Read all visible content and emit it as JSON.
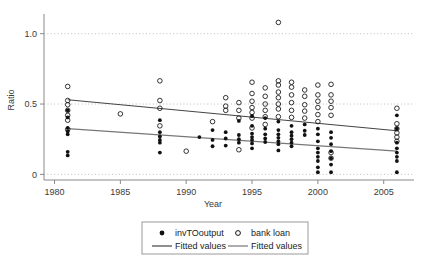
{
  "chart_data": {
    "type": "scatter",
    "title": "",
    "xlabel": "Year",
    "ylabel": "Ratio",
    "xlim": [
      1979.2,
      2007.3
    ],
    "ylim": [
      -0.04,
      1.14
    ],
    "xticks": [
      1980,
      1985,
      1990,
      1995,
      2000,
      2005
    ],
    "xtick_labels": [
      "1980",
      "1985",
      "1990",
      "1995",
      "2000",
      "2005"
    ],
    "yticks": [
      0,
      0.5,
      1.0
    ],
    "ytick_labels": [
      "0",
      "0.5",
      "1.0"
    ],
    "grid": "horizontal-dotted",
    "legend_position": "below-axes",
    "series": [
      {
        "name": "invTOoutput",
        "marker": "filled-circle",
        "color": "#111111",
        "points": [
          [
            1981,
            0.455
          ],
          [
            1981,
            0.405
          ],
          [
            1981,
            0.33
          ],
          [
            1981,
            0.305
          ],
          [
            1981,
            0.285
          ],
          [
            1981,
            0.16
          ],
          [
            1981,
            0.135
          ],
          [
            1988,
            0.385
          ],
          [
            1988,
            0.3
          ],
          [
            1988,
            0.27
          ],
          [
            1988,
            0.245
          ],
          [
            1988,
            0.225
          ],
          [
            1988,
            0.155
          ],
          [
            1991,
            0.265
          ],
          [
            1992,
            0.315
          ],
          [
            1992,
            0.245
          ],
          [
            1992,
            0.2
          ],
          [
            1993,
            0.3
          ],
          [
            1993,
            0.255
          ],
          [
            1993,
            0.205
          ],
          [
            1994,
            0.38
          ],
          [
            1994,
            0.28
          ],
          [
            1994,
            0.25
          ],
          [
            1994,
            0.225
          ],
          [
            1995,
            0.415
          ],
          [
            1995,
            0.345
          ],
          [
            1995,
            0.29
          ],
          [
            1995,
            0.265
          ],
          [
            1995,
            0.245
          ],
          [
            1995,
            0.22
          ],
          [
            1995,
            0.185
          ],
          [
            1996,
            0.4
          ],
          [
            1996,
            0.325
          ],
          [
            1996,
            0.285
          ],
          [
            1996,
            0.255
          ],
          [
            1996,
            0.23
          ],
          [
            1997,
            0.375
          ],
          [
            1997,
            0.315
          ],
          [
            1997,
            0.285
          ],
          [
            1997,
            0.26
          ],
          [
            1997,
            0.235
          ],
          [
            1997,
            0.215
          ],
          [
            1997,
            0.17
          ],
          [
            1998,
            0.345
          ],
          [
            1998,
            0.3
          ],
          [
            1998,
            0.275
          ],
          [
            1998,
            0.25
          ],
          [
            1998,
            0.225
          ],
          [
            1998,
            0.2
          ],
          [
            1999,
            0.355
          ],
          [
            1999,
            0.31
          ],
          [
            1999,
            0.28
          ],
          [
            2000,
            0.325
          ],
          [
            2000,
            0.285
          ],
          [
            2000,
            0.235
          ],
          [
            2000,
            0.185
          ],
          [
            2000,
            0.155
          ],
          [
            2000,
            0.125
          ],
          [
            2000,
            0.095
          ],
          [
            2000,
            0.05
          ],
          [
            2000,
            0.015
          ],
          [
            2001,
            0.3
          ],
          [
            2001,
            0.26
          ],
          [
            2001,
            0.215
          ],
          [
            2001,
            0.165
          ],
          [
            2001,
            0.115
          ],
          [
            2001,
            0.07
          ],
          [
            2001,
            0.015
          ],
          [
            2006,
            0.42
          ],
          [
            2006,
            0.325
          ],
          [
            2006,
            0.225
          ],
          [
            2006,
            0.185
          ],
          [
            2006,
            0.155
          ],
          [
            2006,
            0.125
          ],
          [
            2006,
            0.095
          ],
          [
            2006,
            0.015
          ]
        ]
      },
      {
        "name": "bank loan",
        "marker": "open-circle",
        "color": "#111111",
        "points": [
          [
            1981,
            0.625
          ],
          [
            1981,
            0.525
          ],
          [
            1981,
            0.495
          ],
          [
            1981,
            0.455
          ],
          [
            1981,
            0.42
          ],
          [
            1981,
            0.385
          ],
          [
            1981,
            0.32
          ],
          [
            1985,
            0.43
          ],
          [
            1988,
            0.665
          ],
          [
            1988,
            0.525
          ],
          [
            1988,
            0.47
          ],
          [
            1988,
            0.345
          ],
          [
            1990,
            0.165
          ],
          [
            1992,
            0.375
          ],
          [
            1993,
            0.545
          ],
          [
            1993,
            0.485
          ],
          [
            1993,
            0.455
          ],
          [
            1994,
            0.51
          ],
          [
            1994,
            0.455
          ],
          [
            1994,
            0.4
          ],
          [
            1994,
            0.175
          ],
          [
            1995,
            0.655
          ],
          [
            1995,
            0.575
          ],
          [
            1995,
            0.52
          ],
          [
            1995,
            0.475
          ],
          [
            1995,
            0.44
          ],
          [
            1995,
            0.4
          ],
          [
            1995,
            0.33
          ],
          [
            1996,
            0.615
          ],
          [
            1996,
            0.555
          ],
          [
            1996,
            0.5
          ],
          [
            1996,
            0.455
          ],
          [
            1996,
            0.41
          ],
          [
            1996,
            0.355
          ],
          [
            1997,
            1.08
          ],
          [
            1997,
            0.665
          ],
          [
            1997,
            0.635
          ],
          [
            1997,
            0.585
          ],
          [
            1997,
            0.545
          ],
          [
            1997,
            0.5
          ],
          [
            1997,
            0.465
          ],
          [
            1997,
            0.41
          ],
          [
            1998,
            0.655
          ],
          [
            1998,
            0.62
          ],
          [
            1998,
            0.565
          ],
          [
            1998,
            0.51
          ],
          [
            1998,
            0.455
          ],
          [
            1998,
            0.405
          ],
          [
            1999,
            0.6
          ],
          [
            1999,
            0.555
          ],
          [
            1999,
            0.495
          ],
          [
            1999,
            0.45
          ],
          [
            1999,
            0.4
          ],
          [
            2000,
            0.635
          ],
          [
            2000,
            0.565
          ],
          [
            2000,
            0.52
          ],
          [
            2000,
            0.475
          ],
          [
            2000,
            0.425
          ],
          [
            2000,
            0.375
          ],
          [
            2001,
            0.64
          ],
          [
            2001,
            0.565
          ],
          [
            2001,
            0.52
          ],
          [
            2001,
            0.475
          ],
          [
            2001,
            0.42
          ],
          [
            2001,
            0.155
          ],
          [
            2001,
            0.115
          ],
          [
            2006,
            0.47
          ],
          [
            2006,
            0.36
          ],
          [
            2006,
            0.325
          ],
          [
            2006,
            0.295
          ],
          [
            2006,
            0.265
          ],
          [
            2006,
            0.235
          ]
        ]
      }
    ],
    "fits": [
      {
        "name": "Fitted values",
        "for_series": "bank loan",
        "color": "#444444",
        "x_start": 1981,
        "y_start": 0.53,
        "x_end": 2006,
        "y_end": 0.31
      },
      {
        "name": "Fitted values",
        "for_series": "invTOoutput",
        "color": "#777777",
        "x_start": 1981,
        "y_start": 0.325,
        "x_end": 2006,
        "y_end": 0.165
      }
    ]
  },
  "legend": {
    "entries": [
      {
        "label": "invTOoutput",
        "marker": "filled-circle"
      },
      {
        "label": "bank loan",
        "marker": "open-circle"
      },
      {
        "label": "Fitted values",
        "marker": "line-dark"
      },
      {
        "label": "Fitted values",
        "marker": "line-light"
      }
    ]
  },
  "colors": {
    "marker": "#111111",
    "fit_dark": "#444444",
    "fit_light": "#777777",
    "grid": "#bdbdbd",
    "axis": "#8a8a8a",
    "text": "#3a3a3a",
    "legend_border": "#9a9a9a",
    "background": "#ffffff"
  }
}
